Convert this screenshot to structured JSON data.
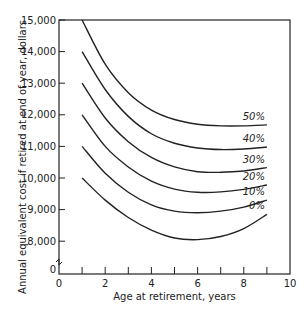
{
  "chart_data": {
    "type": "line",
    "title": "",
    "xlabel": "Age at retirement, years",
    "ylabel": "Annual equivalent cost if retired at end of year, dollars",
    "xlim": [
      0,
      10
    ],
    "ylim_display": [
      8000,
      15000
    ],
    "y_axis_break": true,
    "x_ticks": [
      0,
      2,
      4,
      6,
      8,
      10
    ],
    "x_minor_ticks": [
      1,
      2,
      3,
      4,
      5,
      6,
      7,
      8,
      9
    ],
    "y_tick_labels": [
      "15,000",
      "14,000",
      "13,000",
      "12,000",
      "11,000",
      "10,000",
      "9,000",
      "8,000",
      "0"
    ],
    "grid": false,
    "legend": "inline labels at right end of curves",
    "x": [
      1,
      2,
      3,
      4,
      5,
      6,
      7,
      8,
      9
    ],
    "series": [
      {
        "name": "50%",
        "values": [
          15000,
          13600,
          12700,
          12150,
          11850,
          11700,
          11650,
          11650,
          11680
        ]
      },
      {
        "name": "40%",
        "values": [
          14000,
          12800,
          11950,
          11400,
          11100,
          10950,
          10900,
          10920,
          10980
        ]
      },
      {
        "name": "30%",
        "values": [
          13000,
          11900,
          11150,
          10650,
          10350,
          10200,
          10180,
          10220,
          10330
        ]
      },
      {
        "name": "20%",
        "values": [
          12000,
          11000,
          10350,
          9900,
          9650,
          9550,
          9560,
          9640,
          9780
        ]
      },
      {
        "name": "10%",
        "values": [
          11000,
          10150,
          9550,
          9150,
          8950,
          8900,
          8950,
          9080,
          9300
        ]
      },
      {
        "name": "0%",
        "values": [
          10000,
          9300,
          8750,
          8350,
          8100,
          8050,
          8150,
          8400,
          8850
        ]
      }
    ]
  }
}
